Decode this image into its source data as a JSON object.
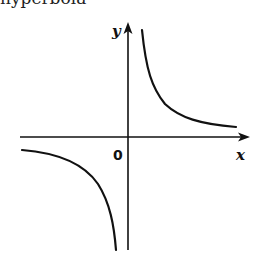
{
  "caption": "hyperbola",
  "axes": {
    "x_label": "x",
    "y_label": "y",
    "origin_label": "0"
  },
  "colors": {
    "stroke": "#111111",
    "background": "#ffffff"
  },
  "curves": {
    "branch_upper_right": "first quadrant branch, approaching y-axis upward and x-axis to the right",
    "branch_lower_left": "third quadrant branch, approaching x-axis to the left and y-axis downward"
  }
}
